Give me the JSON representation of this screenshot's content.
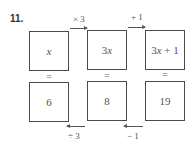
{
  "problem": {
    "number": "11."
  },
  "top_row": [
    {
      "expr": "x",
      "italic": true
    },
    {
      "expr": "3x",
      "coef": "3",
      "var": "x"
    },
    {
      "expr": "3x + 1",
      "coef": "3",
      "var": "x",
      "rest": " + 1"
    }
  ],
  "equals": [
    "=",
    "=",
    "="
  ],
  "bottom_row": [
    {
      "value": "6"
    },
    {
      "value": "8"
    },
    {
      "value": "19"
    }
  ],
  "forward_ops": [
    {
      "label": "× 3",
      "direction": "right"
    },
    {
      "label": "+ 1",
      "direction": "right"
    }
  ],
  "inverse_ops": [
    {
      "label": "÷ 3",
      "direction": "left"
    },
    {
      "label": "− 1",
      "direction": "left"
    }
  ],
  "colors": {
    "border": "#4a4a4a",
    "text": "#555555",
    "background": "#ffffff"
  }
}
